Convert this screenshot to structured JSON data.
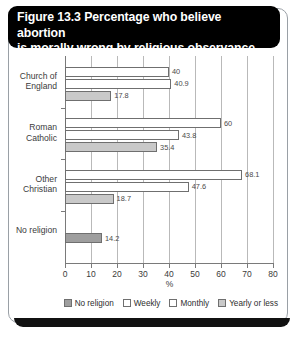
{
  "title": {
    "line1": "Figure 13.3 Percentage who believe abortion",
    "line2": "is morally wrong by religious observance"
  },
  "chart_data": {
    "type": "bar",
    "orientation": "horizontal",
    "title": "Figure 13.3 Percentage who believe abortion is morally wrong by religious observance",
    "xlabel": "%",
    "ylabel": "",
    "xlim": [
      0,
      80
    ],
    "xticks": [
      0,
      10,
      20,
      30,
      40,
      50,
      60,
      70,
      80
    ],
    "grid": true,
    "legend_position": "bottom-right",
    "categories": [
      "Church of England",
      "Roman Catholic",
      "Other Christian",
      "No religion"
    ],
    "series": [
      {
        "name": "Weekly",
        "style": "open",
        "values": [
          40,
          60,
          68.1,
          null
        ]
      },
      {
        "name": "Monthly",
        "style": "open",
        "values": [
          40.9,
          43.8,
          47.6,
          null
        ]
      },
      {
        "name": "Yearly or less",
        "style": "light",
        "values": [
          17.8,
          35.4,
          18.7,
          null
        ]
      },
      {
        "name": "No religion",
        "style": "dark",
        "values": [
          null,
          null,
          null,
          14.2
        ]
      }
    ],
    "legend": [
      {
        "label": "No religion",
        "style": "dark"
      },
      {
        "label": "Weekly",
        "style": "open"
      },
      {
        "label": "Monthly",
        "style": "open"
      },
      {
        "label": "Yearly or less",
        "style": "light"
      }
    ],
    "bars": [
      {
        "category": "Church of England",
        "series": "Weekly",
        "value": 40,
        "label": "40",
        "style": "open"
      },
      {
        "category": "Church of England",
        "series": "Monthly",
        "value": 40.9,
        "label": "40.9",
        "style": "open"
      },
      {
        "category": "Church of England",
        "series": "Yearly or less",
        "value": 17.8,
        "label": "17.8",
        "style": "light"
      },
      {
        "category": "Roman Catholic",
        "series": "Weekly",
        "value": 60,
        "label": "60",
        "style": "open"
      },
      {
        "category": "Roman Catholic",
        "series": "Monthly",
        "value": 43.8,
        "label": "43.8",
        "style": "open"
      },
      {
        "category": "Roman Catholic",
        "series": "Yearly or less",
        "value": 35.4,
        "label": "35.4",
        "style": "light"
      },
      {
        "category": "Other Christian",
        "series": "Weekly",
        "value": 68.1,
        "label": "68.1",
        "style": "open"
      },
      {
        "category": "Other Christian",
        "series": "Monthly",
        "value": 47.6,
        "label": "47.6",
        "style": "open"
      },
      {
        "category": "Other Christian",
        "series": "Yearly or less",
        "value": 18.7,
        "label": "18.7",
        "style": "light"
      },
      {
        "category": "No religion",
        "series": "No religion",
        "value": 14.2,
        "label": "14.2",
        "style": "dark"
      }
    ]
  },
  "colors": {
    "title_background": "#000000",
    "title_text": "#ffffff",
    "bar_open": "#ffffff",
    "bar_light": "#c9c9c9",
    "bar_dark": "#9e9e9e",
    "bar_border": "#6f6f6f",
    "gridline": "#b9b9b9",
    "axis": "#7a7a7a",
    "card_border": "#9aa0a6"
  }
}
